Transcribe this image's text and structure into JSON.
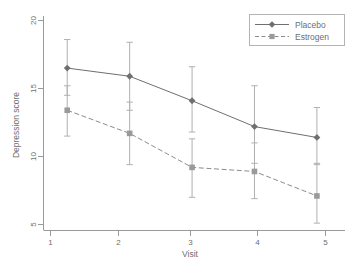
{
  "chart_data": {
    "type": "line",
    "title": "",
    "xlabel": "Visit",
    "ylabel": "Depression score",
    "x": [
      1,
      2,
      3,
      4,
      5
    ],
    "xticklabels": [
      "1",
      "2",
      "3",
      "4",
      "5"
    ],
    "yticks": [
      5,
      10,
      15,
      20
    ],
    "yticklabels": [
      "5",
      "10",
      "15",
      "20"
    ],
    "xlim": [
      0.62,
      5.45
    ],
    "ylim": [
      4.2,
      20.6
    ],
    "grid": false,
    "legend_position": "top-right",
    "errorbars": true,
    "errorbar_type": "confidence-interval",
    "series": [
      {
        "name": "Placebo",
        "color": "#6f6f6f",
        "linestyle": "solid",
        "marker": "diamond",
        "values": [
          16.5,
          15.9,
          14.1,
          12.2,
          11.4
        ],
        "ci_lower": [
          14.5,
          13.4,
          11.8,
          9.5,
          9.4
        ],
        "ci_upper": [
          18.6,
          18.4,
          16.6,
          15.2,
          13.6
        ]
      },
      {
        "name": "Estrogen",
        "color": "#8c8c8c",
        "linestyle": "dashed",
        "marker": "square",
        "values": [
          13.4,
          11.7,
          9.2,
          8.9,
          7.1
        ],
        "ci_lower": [
          11.5,
          9.4,
          7.0,
          6.9,
          5.1
        ],
        "ci_upper": [
          15.2,
          14.0,
          11.3,
          11.0,
          9.5
        ]
      }
    ]
  },
  "legend": {
    "entries": [
      {
        "label": "Placebo"
      },
      {
        "label": "Estrogen"
      }
    ]
  },
  "axes": {
    "x_title": "Visit",
    "y_title": "Depression score"
  }
}
